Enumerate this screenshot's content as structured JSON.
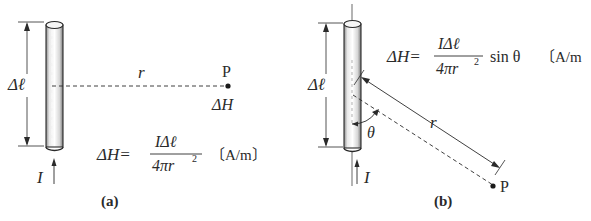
{
  "panel_a": {
    "caption": "(a)",
    "length_label": "Δℓ",
    "current_label": "I",
    "distance_label": "r",
    "point_label": "P",
    "field_label": "ΔH",
    "formula": {
      "lhs": "ΔH=",
      "numerator": "IΔℓ",
      "denominator": "4πr",
      "exponent": "2",
      "suffix": "",
      "unit": "〔A/m〕"
    }
  },
  "panel_b": {
    "caption": "(b)",
    "length_label": "Δℓ",
    "current_label": "I",
    "distance_label": "r",
    "angle_label": "θ",
    "point_label": "P",
    "formula": {
      "lhs": "ΔH=",
      "numerator": "IΔℓ",
      "denominator": "4πr",
      "exponent": "2",
      "suffix": "sin θ",
      "unit": "〔A/m"
    }
  },
  "colors": {
    "line": "#2a2a2a",
    "cylinder_fill": "#f2f2f2",
    "cylinder_shade": "#9a9a9a"
  }
}
